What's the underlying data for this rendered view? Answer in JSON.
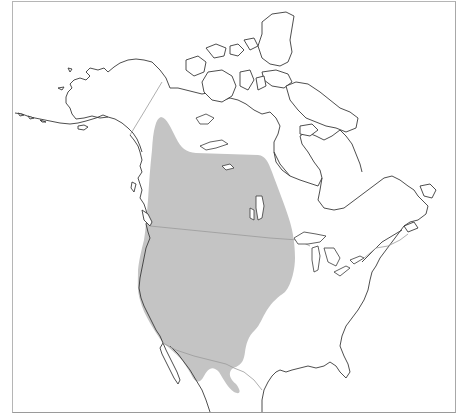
{
  "map": {
    "region": "North America",
    "type": "species range map",
    "layers": [
      {
        "name": "range",
        "description": "shaded distribution range covering western North America from the Yukon/NWT south through the Great Plains and Rockies to northern Mexico",
        "color": "#c4c4c4"
      },
      {
        "name": "coastlines",
        "color": "#3a3a3a"
      },
      {
        "name": "political-borders",
        "color": "#9a9a9a"
      }
    ],
    "background": "#ffffff",
    "frame_color": "#b5b5b5"
  }
}
